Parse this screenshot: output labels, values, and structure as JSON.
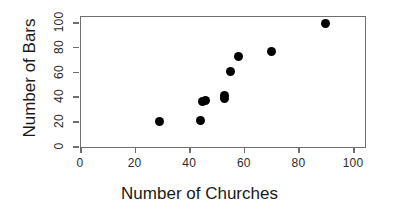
{
  "chart_data": {
    "type": "scatter",
    "title": "",
    "xlabel": "Number of Churches",
    "ylabel": "Number of Bars",
    "xlim": [
      0,
      104
    ],
    "ylim": [
      0,
      105
    ],
    "xticks": [
      0,
      20,
      40,
      60,
      80,
      100
    ],
    "yticks": [
      0,
      20,
      40,
      60,
      80,
      100
    ],
    "xticklabels": [
      "0",
      "20",
      "40",
      "60",
      "80",
      "100"
    ],
    "yticklabels": [
      "0",
      "20",
      "40",
      "60",
      "80",
      "100"
    ],
    "grid": false,
    "legend": null,
    "marker": "filled-circle",
    "marker_color": "#000000",
    "frame_color": "#6e6e6e",
    "points": [
      {
        "x": 29,
        "y": 20
      },
      {
        "x": 44,
        "y": 21
      },
      {
        "x": 45,
        "y": 36
      },
      {
        "x": 46,
        "y": 37
      },
      {
        "x": 53,
        "y": 38
      },
      {
        "x": 53,
        "y": 41
      },
      {
        "x": 55,
        "y": 60
      },
      {
        "x": 58,
        "y": 72
      },
      {
        "x": 70,
        "y": 76
      },
      {
        "x": 90,
        "y": 99
      }
    ]
  }
}
